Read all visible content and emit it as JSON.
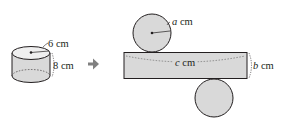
{
  "diagram": {
    "cylinder": {
      "radius_label": "6 cm",
      "height_label": "8 cm"
    },
    "arrow": "➔",
    "net": {
      "radius_var": "a",
      "radius_unit": "cm",
      "length_var": "c",
      "length_unit": "cm",
      "width_var": "b",
      "width_unit": "cm"
    },
    "colors": {
      "fill": "#d9d9d9",
      "stroke": "#231f20",
      "arrow": "#808080"
    }
  }
}
